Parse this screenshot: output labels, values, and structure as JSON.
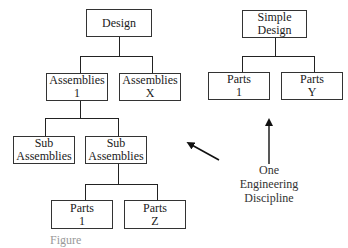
{
  "complex_tree": {
    "root": {
      "line1": "Design",
      "line2": ""
    },
    "assemblies_1": {
      "line1": "Assemblies",
      "line2": "1"
    },
    "assemblies_x": {
      "line1": "Assemblies",
      "line2": "X"
    },
    "sub_assemblies_a": {
      "line1": "Sub",
      "line2": "Assemblies"
    },
    "sub_assemblies_b": {
      "line1": "Sub",
      "line2": "Assemblies"
    },
    "parts_1": {
      "line1": "Parts",
      "line2": "1"
    },
    "parts_z": {
      "line1": "Parts",
      "line2": "Z"
    }
  },
  "simple_tree": {
    "root": {
      "line1": "Simple",
      "line2": "Design"
    },
    "parts_1": {
      "line1": "Parts",
      "line2": "1"
    },
    "parts_y": {
      "line1": "Parts",
      "line2": "Y"
    }
  },
  "annotation": {
    "line1": "One",
    "line2": "Engineering",
    "line3": "Discipline"
  },
  "caption": "Figure"
}
